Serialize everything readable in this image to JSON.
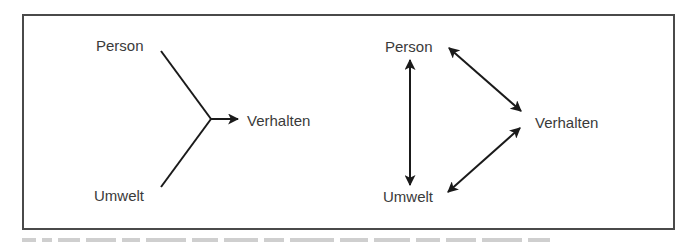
{
  "figure": {
    "frame_color": "#4a4a4a",
    "line_color": "#1a1a1a",
    "text_color": "#3a3a3a"
  },
  "left_diagram": {
    "model": "unidirectional",
    "nodes": {
      "person": "Person",
      "umwelt": "Umwelt",
      "verhalten": "Verhalten"
    },
    "edges": [
      {
        "from": "Person",
        "to": "Verhalten",
        "type": "converging-line"
      },
      {
        "from": "Umwelt",
        "to": "Verhalten",
        "type": "converging-line"
      },
      {
        "from": "junction",
        "to": "Verhalten",
        "type": "arrow"
      }
    ]
  },
  "right_diagram": {
    "model": "reciprocal",
    "nodes": {
      "person": "Person",
      "umwelt": "Umwelt",
      "verhalten": "Verhalten"
    },
    "edges": [
      {
        "from": "Person",
        "to": "Umwelt",
        "type": "double-arrow"
      },
      {
        "from": "Person",
        "to": "Verhalten",
        "type": "double-arrow"
      },
      {
        "from": "Umwelt",
        "to": "Verhalten",
        "type": "double-arrow"
      }
    ]
  }
}
